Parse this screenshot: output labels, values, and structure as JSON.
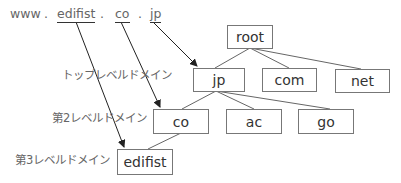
{
  "url": {
    "parts": [
      "www",
      ".",
      "edifist",
      ".",
      "co",
      ".",
      "jp"
    ]
  },
  "labels": {
    "top_level": "トップレベルドメイン",
    "second_level": "第2レベルドメイン",
    "third_level": "第3レベルドメイン"
  },
  "tree": {
    "root": "root",
    "tld": [
      "jp",
      "com",
      "net"
    ],
    "sld": [
      "co",
      "ac",
      "go"
    ],
    "third": "edifist"
  },
  "colors": {
    "line": "#555555",
    "box_border": "#777777",
    "text": "#333333"
  }
}
